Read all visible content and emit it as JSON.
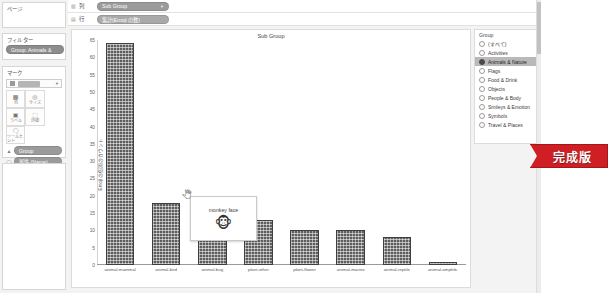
{
  "app": {
    "pages_card_title": "ページ",
    "filters_card_title": "フィルター",
    "marks_card_title": "マーク",
    "filter_pill": "Group: Animals &",
    "mark_type": "自動",
    "mark_buttons": [
      {
        "icon": "color-icon",
        "glyph": "▩",
        "caption": "色"
      },
      {
        "icon": "size-icon",
        "glyph": "◎",
        "caption": "サイズ"
      },
      {
        "icon": "text-icon",
        "glyph": "▣",
        "caption": "ラベル"
      },
      {
        "icon": "detail-icon",
        "glyph": "⬚",
        "caption": "詳細"
      },
      {
        "icon": "tooltip-icon",
        "glyph": "🗨",
        "caption": "ツールヒント"
      }
    ],
    "encodings": [
      {
        "icon": "color-chip-icon",
        "glyph": "▲",
        "label": "Group"
      },
      {
        "icon": "tooltip-chip-icon",
        "glyph": "◯",
        "label": "属性 (Name)"
      }
    ]
  },
  "shelves": {
    "columns_icon": "columns-icon",
    "columns_label": "列",
    "columns_pill": "Sub Group",
    "rows_icon": "rows-icon",
    "rows_label": "行",
    "rows_pill": "集計(Emoji の数)"
  },
  "chart_data": {
    "type": "bar",
    "title": "Sub Group",
    "xlabel": "",
    "ylabel": "Emoji の個別のカウント",
    "ylim": [
      0,
      65
    ],
    "yticks": [
      0,
      5,
      10,
      15,
      20,
      25,
      30,
      35,
      40,
      45,
      50,
      55,
      60,
      65
    ],
    "grid": false,
    "legend_position": "right",
    "categories": [
      "animal-mammal",
      "animal-bird",
      "animal-bug",
      "plant-other",
      "plant-flower",
      "animal-marine",
      "animal-reptile",
      "animal-amphib."
    ],
    "values": [
      64,
      18,
      16,
      13,
      10,
      10,
      8,
      1
    ]
  },
  "tooltip": {
    "title": "monkey face",
    "emoji": "🐵"
  },
  "legend": {
    "title": "Group",
    "items": [
      {
        "label": "(すべて)",
        "selected": false
      },
      {
        "label": "Activities",
        "selected": false
      },
      {
        "label": "Animals & Nature",
        "selected": true
      },
      {
        "label": "Flags",
        "selected": false
      },
      {
        "label": "Food & Drink",
        "selected": false
      },
      {
        "label": "Objects",
        "selected": false
      },
      {
        "label": "People & Body",
        "selected": false
      },
      {
        "label": "Smileys & Emotion",
        "selected": false
      },
      {
        "label": "Symbols",
        "selected": false
      },
      {
        "label": "Travel & Places",
        "selected": false
      }
    ]
  },
  "badge": {
    "label": "完成版",
    "color": "#cf1f25"
  },
  "colors": {
    "bar": "#5e5e5e",
    "accent_red": "#cf1f25",
    "selected_row": "#b9b9b9"
  }
}
